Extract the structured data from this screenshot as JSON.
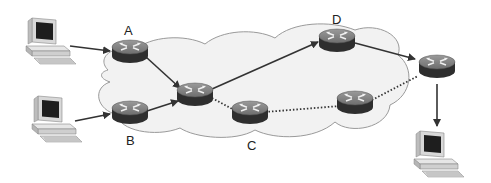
{
  "diagram": {
    "type": "network-routing",
    "labels": {
      "A": "A",
      "B": "B",
      "C": "C",
      "D": "D"
    },
    "nodes": [
      {
        "id": "pc1",
        "kind": "computer",
        "label": ""
      },
      {
        "id": "pc2",
        "kind": "computer",
        "label": ""
      },
      {
        "id": "pc3",
        "kind": "computer",
        "label": ""
      },
      {
        "id": "rA",
        "kind": "router",
        "label": "A"
      },
      {
        "id": "rB",
        "kind": "router",
        "label": "B"
      },
      {
        "id": "rM",
        "kind": "router",
        "label": ""
      },
      {
        "id": "rC",
        "kind": "router",
        "label": "C"
      },
      {
        "id": "rD",
        "kind": "router",
        "label": "D"
      },
      {
        "id": "rE",
        "kind": "router",
        "label": ""
      },
      {
        "id": "rR",
        "kind": "router",
        "label": ""
      }
    ],
    "edges": [
      {
        "from": "pc1",
        "to": "rA",
        "style": "solid-arrow"
      },
      {
        "from": "pc2",
        "to": "rB",
        "style": "solid-arrow"
      },
      {
        "from": "rA",
        "to": "rM",
        "style": "solid-arrow"
      },
      {
        "from": "rB",
        "to": "rM",
        "style": "solid-arrow"
      },
      {
        "from": "rM",
        "to": "rD",
        "style": "solid-arrow"
      },
      {
        "from": "rD",
        "to": "rR",
        "style": "solid-arrow"
      },
      {
        "from": "rR",
        "to": "pc3",
        "style": "solid-arrow"
      },
      {
        "from": "rM",
        "to": "rC",
        "style": "dotted"
      },
      {
        "from": "rC",
        "to": "rE",
        "style": "dotted"
      },
      {
        "from": "rE",
        "to": "rR",
        "style": "dotted"
      }
    ],
    "colors": {
      "cloud_fill": "#f2f2f2",
      "cloud_stroke": "#9a9a9a",
      "router_top": "#8a8a8a",
      "router_side": "#2e2e2e",
      "line": "#333333"
    }
  }
}
